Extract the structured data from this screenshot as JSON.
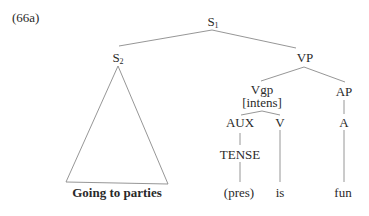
{
  "example_label": "(66a)",
  "nodes": {
    "s1": {
      "cat": "S",
      "sub": "1"
    },
    "s2": {
      "cat": "S",
      "sub": "2"
    },
    "vp": "VP",
    "vgp": "Vgp",
    "vgp_feature": "[intens]",
    "ap": "AP",
    "aux": "AUX",
    "v": "V",
    "a": "A",
    "tense": "TENSE"
  },
  "leaves": {
    "s2_phrase": "Going to parties",
    "pres": "(pres)",
    "is": "is",
    "fun": "fun"
  },
  "colors": {
    "line": "#8a8a8a",
    "text": "#2a2a2a"
  }
}
